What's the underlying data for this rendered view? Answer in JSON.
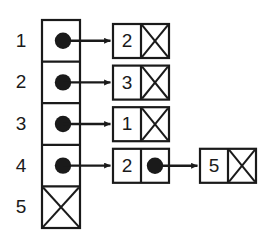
{
  "figure": {
    "background_color": "#ffffff",
    "stroke_color": "#1a1a1a",
    "fill_color": "#1a1a1a"
  },
  "array": {
    "name": "index-array",
    "x": 42,
    "y": 20,
    "width": 38,
    "cell_height": 41.6,
    "cells": [
      {
        "index_label": "1",
        "slot_kind": "pointer"
      },
      {
        "index_label": "2",
        "slot_kind": "pointer"
      },
      {
        "index_label": "3",
        "slot_kind": "pointer"
      },
      {
        "index_label": "4",
        "slot_kind": "pointer"
      },
      {
        "index_label": "5",
        "slot_kind": "null"
      }
    ]
  },
  "index_labels": [
    {
      "text": "1",
      "x": 12,
      "y": 33
    },
    {
      "text": "2",
      "x": 12,
      "y": 74
    },
    {
      "text": "3",
      "x": 12,
      "y": 116
    },
    {
      "text": "4",
      "x": 12,
      "y": 157
    },
    {
      "text": "5",
      "x": 12,
      "y": 199
    }
  ],
  "lists": [
    {
      "name": "list-row-1",
      "row": 1,
      "nodes": [
        {
          "value": "2",
          "x": 113,
          "y": 25,
          "width": 56,
          "height": 28,
          "next": "null"
        }
      ]
    },
    {
      "name": "list-row-2",
      "row": 2,
      "nodes": [
        {
          "value": "3",
          "x": 113,
          "y": 66,
          "width": 56,
          "height": 28,
          "next": "null"
        }
      ]
    },
    {
      "name": "list-row-3",
      "row": 3,
      "nodes": [
        {
          "value": "1",
          "x": 113,
          "y": 108,
          "width": 56,
          "height": 28,
          "next": "null"
        }
      ]
    },
    {
      "name": "list-row-4",
      "row": 4,
      "nodes": [
        {
          "value": "2",
          "x": 113,
          "y": 149,
          "width": 56,
          "height": 28,
          "next": "pointer"
        },
        {
          "value": "5",
          "x": 200,
          "y": 149,
          "width": 56,
          "height": 28,
          "next": "null"
        }
      ]
    }
  ],
  "arrows": [
    {
      "name": "arrow-slot1-to-node",
      "x1": 61,
      "y1": 40.8,
      "x2": 113,
      "y2": 40.8
    },
    {
      "name": "arrow-slot2-to-node",
      "x1": 61,
      "y1": 82.4,
      "x2": 113,
      "y2": 82.4
    },
    {
      "name": "arrow-slot3-to-node",
      "x1": 61,
      "y1": 124.0,
      "x2": 113,
      "y2": 124.0
    },
    {
      "name": "arrow-slot4-to-node",
      "x1": 61,
      "y1": 165.6,
      "x2": 113,
      "y2": 165.6
    },
    {
      "name": "arrow-node2-to-node5",
      "x1": 155,
      "y1": 163.0,
      "x2": 200,
      "y2": 163.0
    }
  ]
}
